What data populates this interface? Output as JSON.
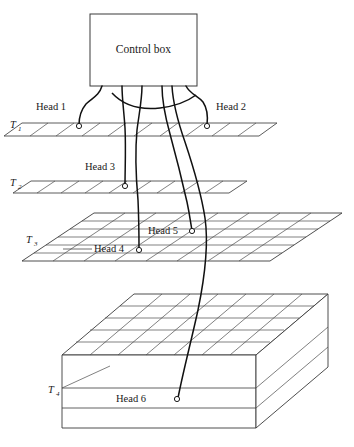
{
  "figure": {
    "title": "Control box",
    "box_label": "Control box",
    "stroke_color": "#1a1a1a",
    "grid_color": "#555555",
    "cable_color": "#111111",
    "background": "#ffffff"
  },
  "control_box": {
    "label": "Control box",
    "x": 90,
    "y": 14,
    "width": 107,
    "height": 72
  },
  "layers": [
    {
      "id": "T1",
      "label": "T",
      "subscript": "1",
      "label_x": 12,
      "label_y": 125,
      "type": "thin-plane"
    },
    {
      "id": "T2",
      "label": "T",
      "subscript": "2",
      "label_x": 12,
      "label_y": 183,
      "type": "thin-plane"
    },
    {
      "id": "T3",
      "label": "T",
      "subscript": "3",
      "label_x": 27,
      "label_y": 240,
      "type": "grid-plane"
    },
    {
      "id": "T4",
      "label": "T",
      "subscript": "4",
      "label_x": 50,
      "label_y": 390,
      "type": "block"
    }
  ],
  "heads": [
    {
      "name": "Head 1",
      "layer": "T1",
      "label_x": 36,
      "label_y": 108,
      "dot_x": 79,
      "dot_y": 126
    },
    {
      "name": "Head 2",
      "layer": "T1",
      "label_x": 219,
      "label_y": 108,
      "dot_x": 207,
      "dot_y": 126
    },
    {
      "name": "Head 3",
      "layer": "T2",
      "label_x": 85,
      "label_y": 168,
      "dot_x": 125,
      "dot_y": 186
    },
    {
      "name": "Head 4",
      "layer": "T3",
      "label_x": 95,
      "label_y": 246,
      "dot_x": 139,
      "dot_y": 250
    },
    {
      "name": "Head 5",
      "layer": "T3",
      "label_x": 150,
      "label_y": 232,
      "dot_x": 192,
      "dot_y": 231
    },
    {
      "name": "Head 6",
      "layer": "T4",
      "label_x": 117,
      "label_y": 400,
      "dot_x": 177,
      "dot_y": 399
    }
  ],
  "cables": {
    "count": 6,
    "description": "Six cables run from the underside of the control box down to Head 1 through Head 6."
  }
}
